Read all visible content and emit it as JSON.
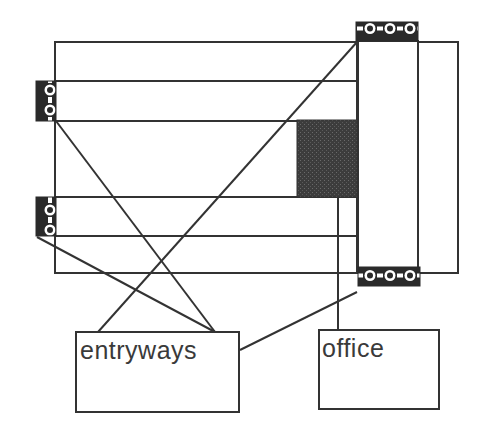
{
  "diagram": {
    "type": "floor-plan-mapping",
    "labels": {
      "entryways": "entryways",
      "office": "office"
    },
    "colors": {
      "stroke": "#333333",
      "background": "#ffffff",
      "office_fill": "#3c3c3c",
      "entry_pattern_dark": "#2a2a2a",
      "entry_pattern_light": "#ffffff"
    },
    "rooms": [
      {
        "id": "main-block",
        "x": 55,
        "y": 42,
        "w": 303,
        "h": 231
      },
      {
        "id": "corridor-upper",
        "x": 55,
        "y": 81,
        "w": 303,
        "h": 40
      },
      {
        "id": "corridor-lower",
        "x": 55,
        "y": 197,
        "w": 303,
        "h": 39
      },
      {
        "id": "tall-room",
        "x": 357,
        "y": 41,
        "w": 61,
        "h": 232
      },
      {
        "id": "right-annex",
        "x": 418,
        "y": 42,
        "w": 40,
        "h": 231
      }
    ],
    "office_area": {
      "x": 297,
      "y": 120,
      "w": 60,
      "h": 77
    },
    "entries": [
      {
        "id": "entry-left-upper",
        "x": 36,
        "y": 81,
        "w": 20,
        "h": 40,
        "orientation": "vertical"
      },
      {
        "id": "entry-left-lower",
        "x": 36,
        "y": 197,
        "w": 20,
        "h": 39,
        "orientation": "vertical"
      },
      {
        "id": "entry-top",
        "x": 356,
        "y": 22,
        "w": 62,
        "h": 19,
        "orientation": "horizontal"
      },
      {
        "id": "entry-bottom",
        "x": 358,
        "y": 267,
        "w": 62,
        "h": 19,
        "orientation": "horizontal"
      }
    ],
    "legend_boxes": [
      {
        "id": "entryways-box",
        "x": 76,
        "y": 332,
        "w": 163,
        "h": 80
      },
      {
        "id": "office-box",
        "x": 319,
        "y": 330,
        "w": 120,
        "h": 79
      }
    ],
    "connectors": [
      {
        "from": "entry-left-upper",
        "to": "entryways-box",
        "x1": 56,
        "y1": 121,
        "x2": 215,
        "y2": 332
      },
      {
        "from": "entry-left-lower",
        "to": "entryways-box",
        "x1": 37,
        "y1": 237,
        "x2": 215,
        "y2": 332
      },
      {
        "from": "entry-top",
        "to": "entryways-box",
        "x1": 357,
        "y1": 42,
        "x2": 98,
        "y2": 332
      },
      {
        "from": "entry-bottom",
        "to": "entryways-box",
        "x1": 357,
        "y1": 292,
        "x2": 240,
        "y2": 350
      },
      {
        "from": "office-area",
        "to": "office-box",
        "x1": 338,
        "y1": 197,
        "x2": 338,
        "y2": 330
      }
    ]
  }
}
